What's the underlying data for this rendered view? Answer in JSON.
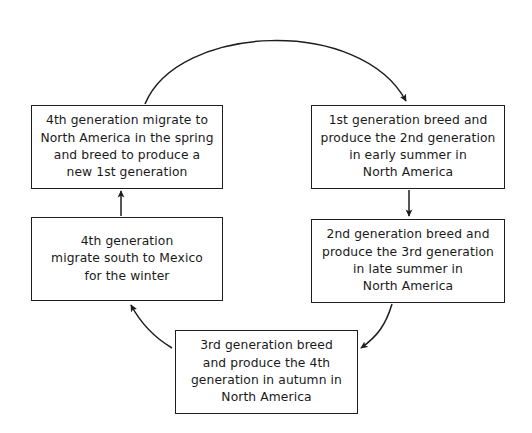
{
  "diagram": {
    "type": "cycle-flowchart",
    "background_color": "#ffffff",
    "stroke_color": "#1d1d1d",
    "text_color": "#1a1a1a",
    "nodes": [
      {
        "id": "gen4-spring",
        "label": "4th generation migrate to\nNorth America in the spring\nand breed to produce a\nnew 1st generation",
        "position": "top-left"
      },
      {
        "id": "gen1",
        "label": "1st generation breed and\nproduce the 2nd generation\nin early summer in\nNorth America",
        "position": "top-right"
      },
      {
        "id": "gen2",
        "label": "2nd generation breed and\nproduce the 3rd generation\nin late summer in\nNorth America",
        "position": "middle-right"
      },
      {
        "id": "gen3",
        "label": "3rd generation breed\nand produce the 4th\ngeneration in autumn in\nNorth America",
        "position": "bottom-center"
      },
      {
        "id": "gen4-mexico",
        "label": "4th generation\nmigrate south to Mexico\nfor the winter",
        "position": "middle-left"
      }
    ],
    "edges": [
      {
        "id": "edge-gen4spring-to-gen1",
        "from": "gen4-spring",
        "to": "gen1",
        "shape": "arc-over-top",
        "arrowhead": "at-target"
      },
      {
        "id": "edge-gen1-to-gen2",
        "from": "gen1",
        "to": "gen2",
        "shape": "straight-vertical-down",
        "arrowhead": "at-target"
      },
      {
        "id": "edge-gen2-to-gen3",
        "from": "gen2",
        "to": "gen3",
        "shape": "curve-down-left",
        "arrowhead": "at-target"
      },
      {
        "id": "edge-gen3-to-gen4mexico",
        "from": "gen3",
        "to": "gen4-mexico",
        "shape": "curve-up-left",
        "arrowhead": "at-target"
      },
      {
        "id": "edge-gen4mexico-to-gen4spring",
        "from": "gen4-mexico",
        "to": "gen4-spring",
        "shape": "straight-vertical-up",
        "arrowhead": "at-target"
      }
    ]
  }
}
